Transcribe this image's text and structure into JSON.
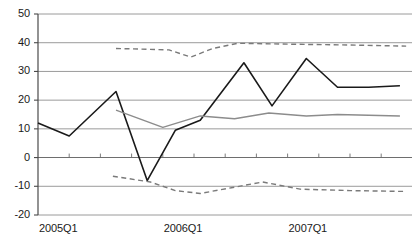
{
  "chart_data": {
    "type": "line",
    "title": "",
    "subtitle": "",
    "xlabel": "",
    "ylabel": "",
    "ylim": [
      -20,
      50
    ],
    "xlim": [
      0,
      12
    ],
    "grid": true,
    "grid_axis": "y",
    "legend": "none",
    "y_ticks": [
      50,
      40,
      30,
      20,
      10,
      0,
      -10,
      -20
    ],
    "y_tick_labels": [
      "50",
      "40",
      "30",
      "20",
      "10",
      "0",
      "-10",
      "-20"
    ],
    "x_tick_labels": [
      "2005Q1",
      "2006Q1",
      "2007Q1"
    ],
    "x_tick_positions": [
      0,
      4,
      8
    ],
    "x_minor_tick_count": 12,
    "x": [
      0,
      1,
      2,
      3,
      4,
      5,
      6,
      7,
      8,
      9,
      10,
      11,
      12
    ],
    "x_quarters": [
      "2005Q1",
      "2005Q2",
      "2005Q3",
      "2005Q4",
      "2006Q1",
      "2006Q2",
      "2006Q3",
      "2006Q4",
      "2007Q1",
      "2007Q2",
      "2007Q3",
      "2007Q4",
      "2008Q1"
    ],
    "series": [
      {
        "name": "solid-black-series",
        "style": "solid",
        "color": "#1a1a1a",
        "width": 1.6,
        "x": [
          0,
          1,
          2.5,
          3.5,
          4.4,
          5.2,
          6.6,
          7.5,
          8.6,
          9.6,
          10.6,
          11.6
        ],
        "values": [
          12,
          7.5,
          23,
          -8,
          9.5,
          13,
          33,
          18,
          34.5,
          24.5,
          24.5,
          25
        ]
      },
      {
        "name": "solid-gray-series",
        "style": "solid",
        "color": "#8c8c8c",
        "width": 1.4,
        "x": [
          2.5,
          4,
          5.2,
          6.3,
          7.4,
          8.6,
          9.6,
          11.6
        ],
        "values": [
          16.5,
          10.5,
          14.5,
          13.5,
          15.5,
          14.5,
          15,
          14.5
        ]
      },
      {
        "name": "dashed-upper-series",
        "style": "dashed",
        "color": "#7a7a7a",
        "width": 1.4,
        "x": [
          2.5,
          4.2,
          4.9,
          5.6,
          6.4,
          8,
          10,
          11.8
        ],
        "values": [
          38,
          37.5,
          35,
          38,
          39.8,
          39.5,
          39.2,
          38.8
        ]
      },
      {
        "name": "dashed-lower-series",
        "style": "dashed",
        "color": "#7a7a7a",
        "width": 1.4,
        "x": [
          2.4,
          3.6,
          4.4,
          5.2,
          6.2,
          7.2,
          8.4,
          10,
          11.8
        ],
        "values": [
          -6.5,
          -8.5,
          -11.5,
          -12.5,
          -10.5,
          -8.5,
          -11,
          -11.5,
          -11.8
        ]
      }
    ]
  },
  "axis": {
    "y_axis_name": "y-axis",
    "x_axis_name": "x-axis"
  }
}
